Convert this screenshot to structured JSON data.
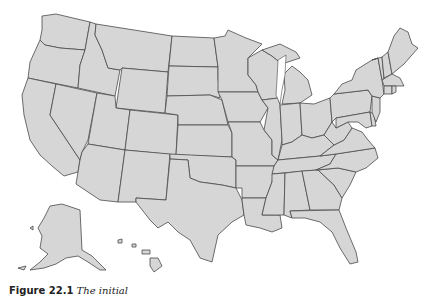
{
  "figure": {
    "type": "outline map",
    "fill_color": "#d6d6d6",
    "border_color": "#4a4a4a",
    "background": "#ffffff"
  },
  "caption": {
    "label": "Figure 22.1",
    "text": "The initial"
  }
}
